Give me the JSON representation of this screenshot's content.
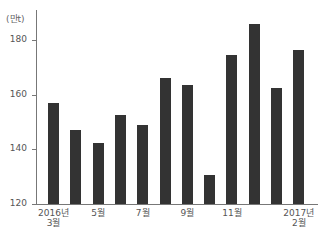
{
  "chart_data": {
    "type": "bar",
    "title": "",
    "unit_label": "(만t)",
    "xlabel": "",
    "ylabel": "(만t)",
    "ylim": [
      120,
      190
    ],
    "yticks": [
      120,
      140,
      160,
      180
    ],
    "grid": false,
    "legend": null,
    "categories": [
      "2016년 3월",
      "4월",
      "5월",
      "6월",
      "7월",
      "8월",
      "9월",
      "10월",
      "11월",
      "12월",
      "2017년 1월",
      "2017년 2월"
    ],
    "x_tick_labels": [
      {
        "index": 0,
        "line1": "2016년",
        "line2": "3월"
      },
      {
        "index": 2,
        "line1": "5월",
        "line2": ""
      },
      {
        "index": 4,
        "line1": "7월",
        "line2": ""
      },
      {
        "index": 6,
        "line1": "9월",
        "line2": ""
      },
      {
        "index": 8,
        "line1": "11월",
        "line2": ""
      },
      {
        "index": 11,
        "line1": "2017년",
        "line2": "2월"
      }
    ],
    "values": [
      157,
      147,
      142.5,
      152.5,
      149,
      166,
      163.5,
      130.5,
      174.5,
      186,
      162.5,
      176.5
    ],
    "bar_color": "#333333"
  }
}
